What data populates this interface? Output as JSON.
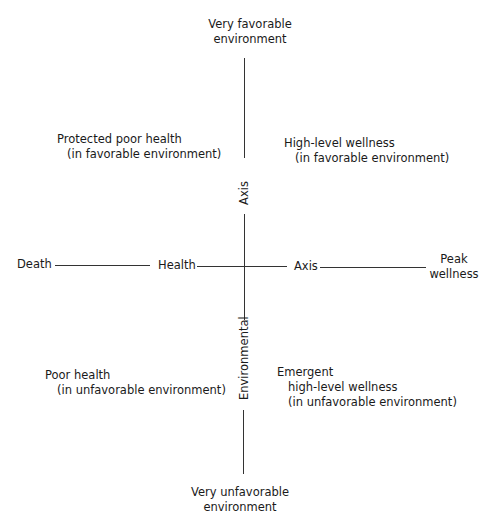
{
  "diagram": {
    "vertical_axis": {
      "top_label": [
        "Very favorable",
        "environment"
      ],
      "bottom_label": [
        "Very unfavorable",
        "environment"
      ],
      "upper_word": "Axis",
      "lower_word": "Environmental"
    },
    "horizontal_axis": {
      "left_end": "Death",
      "left_word": "Health",
      "right_word": "Axis",
      "right_end": [
        "Peak",
        "wellness"
      ]
    },
    "quadrants": {
      "upper_left": [
        "Protected poor health",
        "(in favorable environment)"
      ],
      "upper_right": [
        "High-level wellness",
        "(in favorable environment)"
      ],
      "lower_left": [
        "Poor health",
        "(in unfavorable environment)"
      ],
      "lower_right": [
        "Emergent",
        "high-level wellness",
        "(in unfavorable environment)"
      ]
    },
    "colors": {
      "line": "#333333",
      "text": "#1a1a1a",
      "background": "#ffffff"
    }
  }
}
